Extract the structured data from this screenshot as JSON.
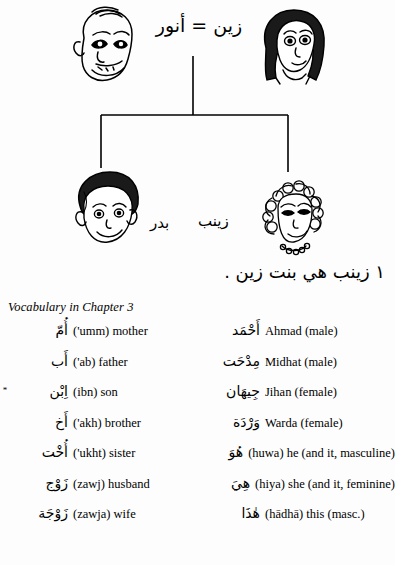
{
  "tree": {
    "couple_line": "زين = أنور",
    "couple_names": {
      "husband": "أنور",
      "wife": "زين",
      "separator": "="
    },
    "children": [
      {
        "name": "بدر",
        "label": "Badr",
        "position": "left"
      },
      {
        "name": "زينب",
        "label": "Zaynab",
        "position": "right"
      }
    ],
    "faces": [
      {
        "name": "father-face",
        "position": "top-left"
      },
      {
        "name": "mother-face",
        "position": "top-right"
      },
      {
        "name": "son-face",
        "position": "bottom-left"
      },
      {
        "name": "daughter-face",
        "position": "bottom-right"
      }
    ]
  },
  "sentence": {
    "number": "١",
    "text": "زينب هي بنت زين .",
    "full": "١ زينب هي بنت زين ."
  },
  "vocabulary": {
    "title": "Vocabulary in Chapter 3",
    "rows": [
      {
        "left": {
          "star": "",
          "arabic": "أُمّ",
          "gloss": "('umm) mother"
        },
        "right": {
          "star": "",
          "arabic": "أَحْمَد",
          "gloss": "Ahmad (male)"
        }
      },
      {
        "left": {
          "star": "",
          "arabic": "أَب",
          "gloss": "('ab) father"
        },
        "right": {
          "star": "",
          "arabic": "مِدْحَت",
          "gloss": "Midhat (male)"
        }
      },
      {
        "left": {
          "star": "*",
          "arabic": "اِبْن",
          "gloss": "(ibn) son"
        },
        "right": {
          "star": "",
          "arabic": "جِيهَان",
          "gloss": "Jihan (female)"
        }
      },
      {
        "left": {
          "star": "",
          "arabic": "أَخ",
          "gloss": "('akh) brother"
        },
        "right": {
          "star": "",
          "arabic": "وَرْدَة",
          "gloss": "Warda (female)"
        }
      },
      {
        "left": {
          "star": "",
          "arabic": "أُخْت",
          "gloss": "('ukht) sister"
        },
        "right": {
          "star": "",
          "arabic": "هُوَ",
          "gloss": "(huwa) he (and it, masculine)"
        }
      },
      {
        "left": {
          "star": "",
          "arabic": "زَوْج",
          "gloss": "(zawj) husband"
        },
        "right": {
          "star": "",
          "arabic": "هِيَ",
          "gloss": "(hiya) she (and it, feminine)"
        }
      },
      {
        "left": {
          "star": "",
          "arabic": "زَوْجَة",
          "gloss": "(zawja) wife"
        },
        "right": {
          "star": "",
          "arabic": "هٰذَا",
          "gloss": "(hādhā) this (masc.)"
        }
      }
    ]
  },
  "colors": {
    "ink": "#000000",
    "paper": "#fdfdfd"
  }
}
